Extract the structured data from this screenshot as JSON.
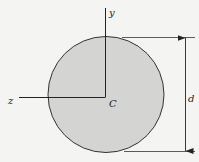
{
  "diagram": {
    "labels": {
      "y_axis": "y",
      "z_axis": "z",
      "centroid": "C",
      "diameter": "d"
    },
    "colors": {
      "background": "#f4f4f2",
      "fill": "#d4d4d2",
      "stroke": "#222222"
    }
  }
}
